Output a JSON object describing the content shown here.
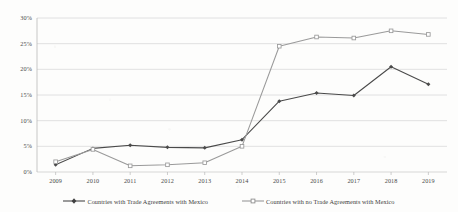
{
  "chart_data": {
    "type": "line",
    "title": "",
    "subtitle": "",
    "xlabel": "",
    "ylabel": "",
    "categories": [
      "2009",
      "2010",
      "2011",
      "2012",
      "2013",
      "2014",
      "2015",
      "2016",
      "2017",
      "2018",
      "2019"
    ],
    "series": [
      {
        "name": "Countries with Trade Agreements with Mexico",
        "color": "#4a4a4a",
        "marker": "filled-diamond",
        "values": [
          1.4,
          4.6,
          5.2,
          4.8,
          4.7,
          6.3,
          13.8,
          15.4,
          14.9,
          20.5,
          17.1
        ]
      },
      {
        "name": "Countries with no Trade Agreements with Mexico",
        "color": "#9a9a9a",
        "marker": "open-square",
        "values": [
          2.0,
          4.4,
          1.2,
          1.4,
          1.8,
          5.0,
          24.5,
          26.3,
          26.1,
          27.5,
          26.8
        ]
      }
    ],
    "ylim": [
      0,
      30
    ],
    "yticks": [
      "0%",
      "5%",
      "10%",
      "15%",
      "20%",
      "25%",
      "30%"
    ],
    "ytick_values": [
      0,
      5,
      10,
      15,
      20,
      25,
      30
    ],
    "grid": true,
    "grid_axis": "y",
    "legend_position": "bottom"
  },
  "legend": {
    "entries": [
      {
        "label": "Countries with Trade Agreements with Mexico"
      },
      {
        "label": "Countries with no Trade Agreements with Mexico"
      }
    ]
  },
  "colors": {
    "series_dark": "#4a4a4a",
    "series_light": "#9a9a9a",
    "gridline": "#d2d2d2",
    "axis": "#b9b9b9",
    "text": "#4a4a4a",
    "background": "#fdfdfc"
  }
}
